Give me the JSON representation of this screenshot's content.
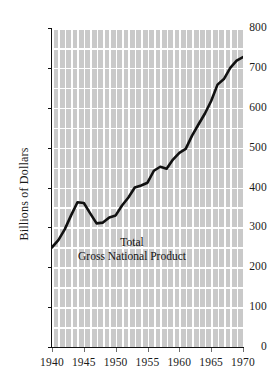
{
  "chart_data": {
    "type": "line",
    "title": "",
    "subtitle": "",
    "xlabel": "",
    "ylabel": "Billions of Dollars",
    "xlim": [
      1940,
      1970
    ],
    "ylim": [
      0,
      800
    ],
    "grid": true,
    "legend_position": "inline-annotation",
    "x_ticks": [
      "1940",
      "1945",
      "1950",
      "1955",
      "1960",
      "1965",
      "1970"
    ],
    "x_tick_values": [
      1940,
      1945,
      1950,
      1955,
      1960,
      1965,
      1970
    ],
    "y_ticks": [
      "0",
      "100",
      "200",
      "300",
      "400",
      "500",
      "600",
      "700",
      "800"
    ],
    "y_tick_values": [
      0,
      100,
      200,
      300,
      400,
      500,
      600,
      700,
      800
    ],
    "y_minor_gridline_interval": 50,
    "annotations": [
      {
        "name": "series-label",
        "line1": "Total",
        "line2": "Gross National Product",
        "x": 1950.5,
        "y": 310
      }
    ],
    "series": [
      {
        "name": "Total Gross National Product",
        "color": "#111111",
        "line_width": 2.6,
        "x": [
          1940,
          1941,
          1942,
          1943,
          1944,
          1945,
          1946,
          1947,
          1948,
          1949,
          1950,
          1951,
          1952,
          1953,
          1954,
          1955,
          1956,
          1957,
          1958,
          1959,
          1960,
          1961,
          1962,
          1963,
          1964,
          1965,
          1966,
          1967,
          1968,
          1969,
          1970
        ],
        "values": [
          250,
          268,
          295,
          330,
          363,
          361,
          335,
          310,
          312,
          325,
          330,
          355,
          375,
          400,
          405,
          412,
          442,
          452,
          447,
          470,
          487,
          497,
          530,
          558,
          585,
          617,
          658,
          672,
          700,
          718,
          727
        ]
      }
    ]
  },
  "axes": {
    "y_axis_title": "Billions of Dollars"
  },
  "colors": {
    "grid_fill": "#c9c9c9",
    "gridline": "#ffffff",
    "line": "#111111",
    "axis": "#111111",
    "text": "#1a1a1a",
    "background": "#ffffff"
  }
}
